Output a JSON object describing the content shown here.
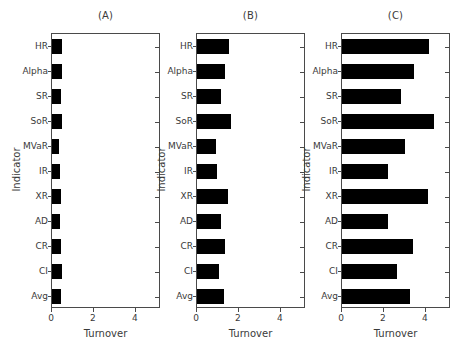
{
  "chart_data": {
    "type": "bar",
    "title": "",
    "orientation": "horizontal",
    "grid": false,
    "legend": null,
    "xlabel": "Turnover",
    "ylabel": "Indicator",
    "xlim": [
      0,
      5.2
    ],
    "xticks": [
      0,
      2,
      4
    ],
    "xtick_labels": [
      "0",
      "2",
      "4"
    ],
    "categories": [
      "HR",
      "Alpha",
      "SR",
      "SoR",
      "MVaR",
      "IR",
      "XR",
      "AD",
      "CR",
      "CI",
      "Avg"
    ],
    "panels": [
      {
        "title": "(A)",
        "values": [
          0.48,
          0.47,
          0.45,
          0.5,
          0.35,
          0.38,
          0.44,
          0.4,
          0.45,
          0.47,
          0.45
        ]
      },
      {
        "title": "(B)",
        "values": [
          1.55,
          1.35,
          1.15,
          1.6,
          0.92,
          0.95,
          1.5,
          1.15,
          1.35,
          1.05,
          1.3
        ]
      },
      {
        "title": "(C)",
        "values": [
          4.15,
          3.45,
          2.8,
          4.4,
          3.0,
          2.2,
          4.1,
          2.2,
          3.4,
          2.6,
          3.25
        ]
      }
    ]
  },
  "panel_a": {
    "title": "(A)",
    "xlabel": "Turnover",
    "ylabel": "Indicator"
  },
  "panel_b": {
    "title": "(B)",
    "xlabel": "Turnover",
    "ylabel": "Indicator"
  },
  "panel_c": {
    "title": "(C)",
    "xlabel": "Turnover",
    "ylabel": "Indicator"
  },
  "colors": {
    "bar": "#000000",
    "axis": "#4a4a4a",
    "text": "#3a3a3a",
    "background": "#ffffff"
  }
}
